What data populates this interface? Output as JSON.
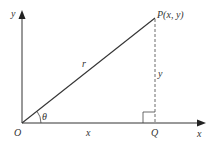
{
  "diagram": {
    "axes": {
      "x_axis_label": "x",
      "y_axis_label": "y"
    },
    "points": {
      "origin_label": "O",
      "point_label_letter": "P",
      "point_label_coords": "(x, y)",
      "foot_label": "Q"
    },
    "segments": {
      "hypotenuse_label": "r",
      "vertical_label": "y",
      "horizontal_label": "x"
    },
    "angle": {
      "label": "θ"
    },
    "colors": {
      "line": "#333333",
      "background": "#ffffff"
    }
  }
}
